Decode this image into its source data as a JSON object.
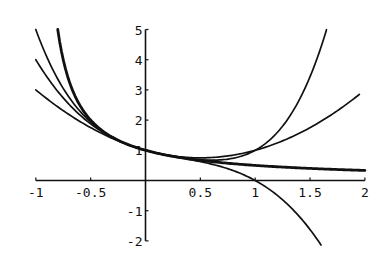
{
  "chart_data": {
    "type": "line",
    "title": "",
    "xlabel": "",
    "ylabel": "",
    "xlim": [
      -1,
      2
    ],
    "ylim": [
      -2,
      5
    ],
    "grid": false,
    "legend": null,
    "x_ticks": [
      "-1",
      "-0.5",
      "0.5",
      "1",
      "1.5",
      "2"
    ],
    "x_tick_values": [
      -1,
      -0.5,
      0.5,
      1,
      1.5,
      2
    ],
    "y_ticks": [
      "-2",
      "-1",
      "1",
      "2",
      "3",
      "4",
      "5"
    ],
    "y_tick_values": [
      -2,
      -1,
      1,
      2,
      3,
      4,
      5
    ],
    "series": [
      {
        "name": "1/(1+x)",
        "style": "thick",
        "x": [
          -0.8,
          -0.7,
          -0.6,
          -0.5,
          -0.4,
          -0.2,
          0,
          0.25,
          0.5,
          0.75,
          1,
          1.25,
          1.5,
          1.75,
          2
        ],
        "y": [
          5,
          3.33,
          2.5,
          2,
          1.67,
          1.25,
          1,
          0.8,
          0.67,
          0.57,
          0.5,
          0.44,
          0.4,
          0.36,
          0.33
        ]
      },
      {
        "name": "1 - x + x^2",
        "style": "thin",
        "x": [
          -1,
          -0.5,
          0,
          0.5,
          1,
          1.5,
          1.95
        ],
        "y": [
          3,
          1.75,
          1,
          0.75,
          1,
          1.75,
          2.85
        ]
      },
      {
        "name": "1 - x + x^2 - x^3",
        "style": "thin",
        "x": [
          -1,
          -0.5,
          0,
          0.5,
          1,
          1.25,
          1.5,
          1.6
        ],
        "y": [
          4,
          1.875,
          1,
          0.625,
          0,
          -0.64,
          -1.63,
          -2.06
        ]
      },
      {
        "name": "1 - x + x^2 - x^3 + x^4",
        "style": "thin",
        "x": [
          -1,
          -0.5,
          0,
          0.5,
          1,
          1.25,
          1.5,
          1.65
        ],
        "y": [
          5,
          1.94,
          1,
          0.69,
          1,
          1.8,
          3.44,
          5.0
        ]
      }
    ]
  }
}
